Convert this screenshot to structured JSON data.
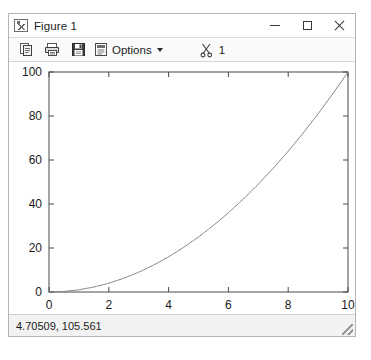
{
  "window": {
    "title": "Figure 1",
    "icon": "figure-icon",
    "controls": {
      "minimize": "–",
      "maximize": "□",
      "close": "×"
    }
  },
  "toolbar": {
    "items": [
      {
        "name": "copy-button",
        "icon": "copy-icon",
        "label": ""
      },
      {
        "name": "print-button",
        "icon": "print-icon",
        "label": ""
      },
      {
        "name": "save-button",
        "icon": "save-icon",
        "label": ""
      },
      {
        "name": "options-button",
        "icon": "options-icon",
        "label": "Options"
      }
    ],
    "options_label": "Options",
    "cut_icon": "scissors-icon",
    "cut_count": "1"
  },
  "statusbar": {
    "coordinates": "4.70509, 105.561"
  },
  "chart_data": {
    "type": "line",
    "title": "",
    "xlabel": "",
    "ylabel": "",
    "xlim": [
      0,
      10
    ],
    "ylim": [
      0,
      100
    ],
    "xticks": [
      0,
      2,
      4,
      6,
      8,
      10
    ],
    "yticks": [
      0,
      20,
      40,
      60,
      80,
      100
    ],
    "grid": false,
    "legend": null,
    "line_color": "#808080",
    "series": [
      {
        "name": "y = x^2",
        "x": [
          0,
          0.5,
          1,
          1.5,
          2,
          2.5,
          3,
          3.5,
          4,
          4.5,
          5,
          5.5,
          6,
          6.5,
          7,
          7.5,
          8,
          8.5,
          9,
          9.5,
          10
        ],
        "values": [
          0,
          0.25,
          1,
          2.25,
          4,
          6.25,
          9,
          12.25,
          16,
          20.25,
          25,
          30.25,
          36,
          42.25,
          49,
          56.25,
          64,
          72.25,
          81,
          90.25,
          100
        ]
      }
    ]
  }
}
